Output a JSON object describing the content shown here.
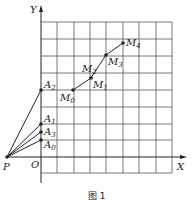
{
  "figure": {
    "caption": "图 1",
    "axes": {
      "x_label": "X",
      "y_label": "Y",
      "origin_label": "O"
    },
    "grid": {
      "cols": 8,
      "rows": 9,
      "color": "#555555"
    },
    "points": {
      "P": {
        "label": "P"
      },
      "A0": {
        "label": "A",
        "sub": "0"
      },
      "A1": {
        "label": "A",
        "sub": "1"
      },
      "A2": {
        "label": "A",
        "sub": "2"
      },
      "A3": {
        "label": "A",
        "sub": "3"
      },
      "M0": {
        "label": "M",
        "sub": "0"
      },
      "M1": {
        "label": "M",
        "sub": "1"
      },
      "M2": {
        "label": "M",
        "sub": "2"
      },
      "M3": {
        "label": "M",
        "sub": "3"
      },
      "M4": {
        "label": "M",
        "sub": "4"
      }
    }
  }
}
